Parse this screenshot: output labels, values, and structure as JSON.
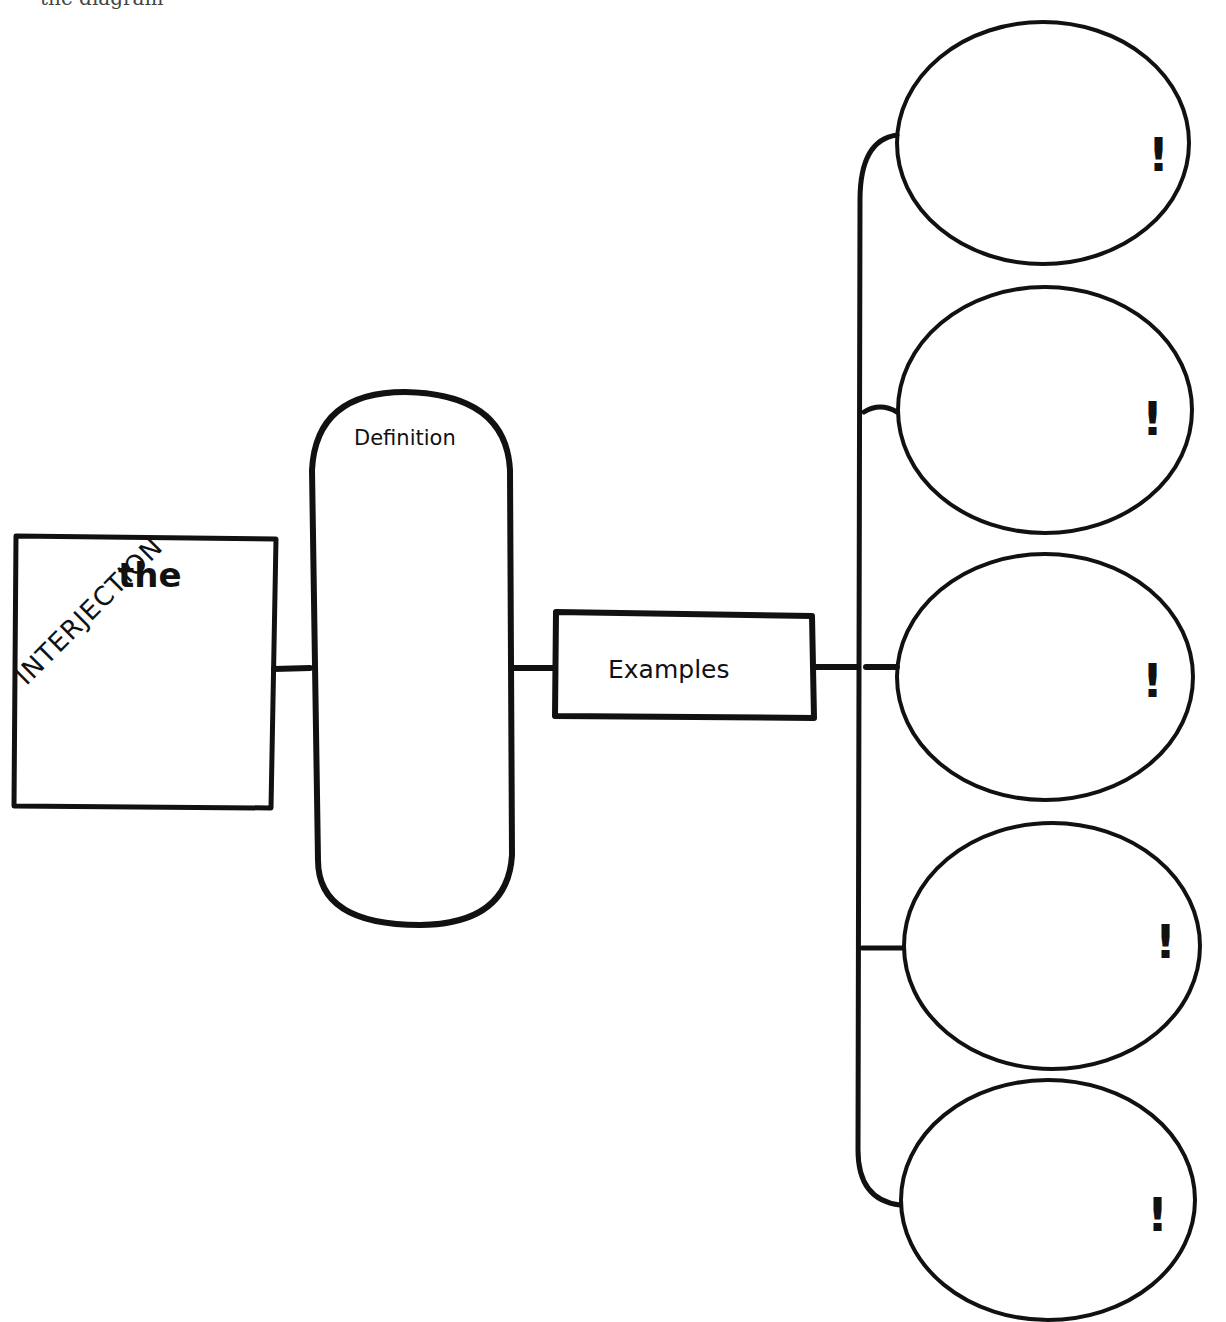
{
  "header": {
    "clipped_title": "the diagram"
  },
  "diagram": {
    "main_box": {
      "top_text": "the",
      "diagonal_text": "INTERJECTION"
    },
    "definition_box": {
      "label": "Definition",
      "content": ""
    },
    "examples_box": {
      "label": "Examples"
    },
    "example_circles": [
      {
        "mark": "!",
        "content": ""
      },
      {
        "mark": "!",
        "content": ""
      },
      {
        "mark": "!",
        "content": ""
      },
      {
        "mark": "!",
        "content": ""
      },
      {
        "mark": "!",
        "content": ""
      }
    ]
  },
  "colors": {
    "ink": "#111111",
    "paper": "#ffffff"
  }
}
